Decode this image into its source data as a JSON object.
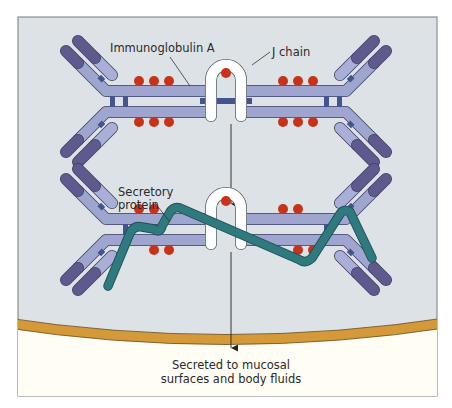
{
  "figure": {
    "type": "diagram",
    "colors": {
      "background": "#dde2e6",
      "frame": "#7a7a7a",
      "heavy_chain": "#9ea6cf",
      "light_chain_dark": "#5e5a8e",
      "light_chain_light": "#a9afd6",
      "hinge": "#43558f",
      "carbohydrate_dots": "#c8321a",
      "j_chain": "#ffffff",
      "secretory_component": "#2f7a7e",
      "membrane": "#d49a3a",
      "lumen": "#fffdf4"
    }
  },
  "labels": {
    "iga": "Immunoglobulin A",
    "j_chain": "J chain",
    "secretory_line1": "Secretory",
    "secretory_line2": "protein",
    "secreted_line1": "Secreted to mucosal",
    "secreted_line2": "surfaces and body fluids"
  }
}
